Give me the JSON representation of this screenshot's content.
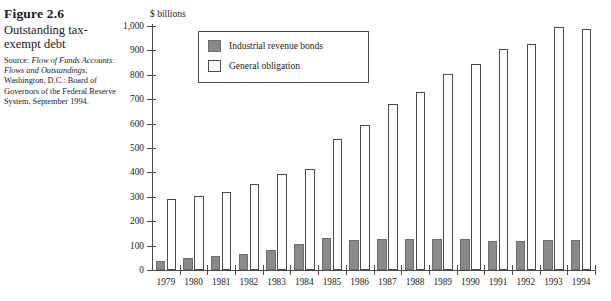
{
  "caption": {
    "figure_number": "Figure 2.6",
    "title": "Outstanding tax-exempt debt",
    "source_prefix": "Source: ",
    "source_italic_1": "Flow of Funds Accounts: Flows and Outstandings",
    "source_rest": ", Washington, D.C.: Board of Governors of the Federal Reserve System, September 1994."
  },
  "chart_data": {
    "type": "bar",
    "title": "Outstanding tax-exempt debt",
    "xlabel": "",
    "ylabel": "$ billions",
    "unit_label": "$ billions",
    "ylim": [
      0,
      1000
    ],
    "ytick_step": 100,
    "grid": false,
    "legend_position": "top-left-inside",
    "categories": [
      "1979",
      "1980",
      "1981",
      "1982",
      "1983",
      "1984",
      "1985",
      "1986",
      "1987",
      "1988",
      "1989",
      "1990",
      "1991",
      "1992",
      "1993",
      "1994"
    ],
    "ytick_labels": [
      "0",
      "100",
      "200",
      "300",
      "400",
      "500",
      "600",
      "700",
      "800",
      "900",
      "1,000"
    ],
    "series": [
      {
        "name": "Industrial revenue bonds",
        "color": "#8a8a8a",
        "values": [
          38,
          48,
          57,
          65,
          82,
          108,
          133,
          123,
          127,
          127,
          126,
          127,
          118,
          120,
          122,
          122
        ]
      },
      {
        "name": "General obligation",
        "color": "#ffffff",
        "values": [
          293,
          303,
          320,
          352,
          395,
          415,
          537,
          595,
          682,
          730,
          803,
          845,
          905,
          925,
          995,
          988
        ]
      }
    ]
  }
}
